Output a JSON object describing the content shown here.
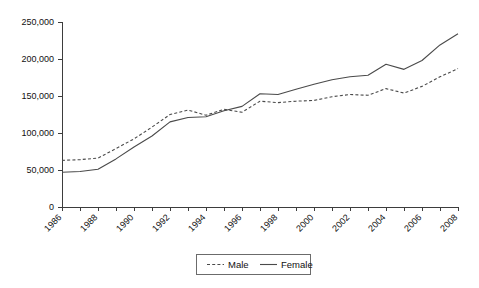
{
  "chart_data": {
    "type": "line",
    "title": "",
    "subtitle": "",
    "xlabel": "",
    "ylabel": "",
    "xlim": [
      1986,
      2008
    ],
    "ylim": [
      0,
      250000
    ],
    "yticks": [
      0,
      50000,
      100000,
      150000,
      200000,
      250000
    ],
    "ytick_labels": [
      "0",
      "50,000",
      "100,000",
      "150,000",
      "200,000",
      "250,000"
    ],
    "x": [
      1986,
      1987,
      1988,
      1989,
      1990,
      1991,
      1992,
      1993,
      1994,
      1995,
      1996,
      1997,
      1998,
      1999,
      2000,
      2001,
      2002,
      2003,
      2004,
      2005,
      2006,
      2007,
      2008
    ],
    "xtick_labels": [
      "1986",
      "1988",
      "1990",
      "1992",
      "1994",
      "1996",
      "1998",
      "2000",
      "2002",
      "2004",
      "2006",
      "2008"
    ],
    "xtick_label_rotation": -45,
    "xtick_label_interval": 2,
    "grid": false,
    "legend_position": "bottom-center",
    "series": [
      {
        "name": "Male",
        "style": "dashed",
        "color": "#4a4a4a",
        "values": [
          63000,
          64000,
          66000,
          79000,
          92000,
          108000,
          125000,
          131000,
          124000,
          132000,
          128000,
          143000,
          141000,
          143000,
          144000,
          149000,
          152000,
          151000,
          160000,
          154000,
          163000,
          176000,
          187000
        ]
      },
      {
        "name": "Female",
        "style": "solid",
        "color": "#4a4a4a",
        "values": [
          47000,
          48000,
          51000,
          65000,
          81000,
          96000,
          115000,
          121000,
          122000,
          130000,
          136000,
          153000,
          152000,
          159000,
          166000,
          172000,
          176000,
          178000,
          193000,
          186000,
          198000,
          219000,
          234000
        ]
      }
    ],
    "legend": [
      {
        "label": "Male",
        "style": "dashed"
      },
      {
        "label": "Female",
        "style": "solid"
      }
    ]
  },
  "colors": {
    "axis": "#3d3d3d",
    "series": "#4a4a4a",
    "text": "#111111",
    "background": "#ffffff",
    "legend_border": "#6b6b6b"
  }
}
